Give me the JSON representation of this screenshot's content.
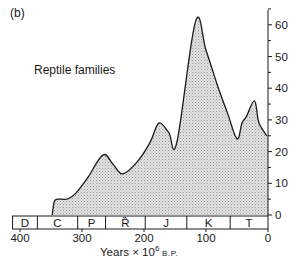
{
  "figure": {
    "panel_label": "(b)",
    "series_label": "Reptile families",
    "xlabel_prefix": "Years × 10",
    "xlabel_exp": "6",
    "xlabel_suffix": " B.P."
  },
  "colors": {
    "line": "#1a1a1a",
    "fill": "#d4d4d4",
    "axis": "#1a1a1a"
  },
  "chart_data": {
    "type": "area",
    "title": "Reptile families",
    "panel": "(b)",
    "xlabel": "Years × 10^6 B.P.",
    "ylabel": "",
    "xlim": [
      400,
      0
    ],
    "ylim": [
      0,
      65
    ],
    "x_ticks": [
      400,
      300,
      200,
      100,
      0
    ],
    "y_ticks": [
      0,
      10,
      20,
      30,
      40,
      50,
      60
    ],
    "y_axis_position": "right",
    "grid": false,
    "legend": "none",
    "series": [
      {
        "name": "Reptile families",
        "x": [
          348,
          345,
          340,
          325,
          315,
          305,
          290,
          266,
          250,
          234,
          210,
          190,
          176,
          160,
          147,
          117,
          100,
          80,
          65,
          50,
          42,
          35,
          22,
          16,
          12,
          2
        ],
        "values": [
          0,
          4,
          5,
          5,
          6,
          8,
          12,
          19,
          16,
          13,
          17,
          23,
          29,
          26,
          23,
          61,
          52,
          40,
          32,
          24,
          29,
          31,
          36,
          30,
          28,
          25
        ]
      }
    ],
    "geologic_periods": [
      {
        "label": "D",
        "start": 400,
        "end": 372
      },
      {
        "label": "C",
        "start": 372,
        "end": 307
      },
      {
        "label": "P",
        "start": 307,
        "end": 262
      },
      {
        "label": "Ȑ",
        "start": 262,
        "end": 198
      },
      {
        "label": "J",
        "start": 198,
        "end": 131
      },
      {
        "label": "K",
        "start": 131,
        "end": 61
      },
      {
        "label": "T",
        "start": 61,
        "end": 0
      }
    ]
  }
}
